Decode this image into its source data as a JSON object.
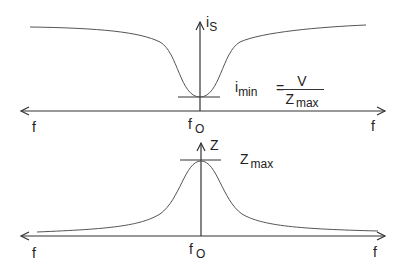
{
  "top_diagram": {
    "y_axis_label": "i",
    "y_axis_label_sub": "S",
    "x_axis_left_label": "f",
    "x_axis_right_label": "f",
    "center_label": "f",
    "center_label_sub": "O",
    "formula": {
      "lhs": "i",
      "lhs_sub": "min",
      "equals": "=",
      "numerator": "V",
      "denominator": "Z",
      "denominator_sub": "max"
    },
    "curve": "inverted resonance dip (series current minimum at f0)"
  },
  "bottom_diagram": {
    "y_axis_label": "Z",
    "x_axis_left_label": "f",
    "x_axis_right_label": "f",
    "center_label": "f",
    "center_label_sub": "O",
    "peak_label": "Z",
    "peak_label_sub": "max",
    "curve": "resonance peak (impedance maximum at f0)"
  },
  "colors": {
    "line": "#333333",
    "curve": "#555555",
    "background": "#ffffff"
  }
}
